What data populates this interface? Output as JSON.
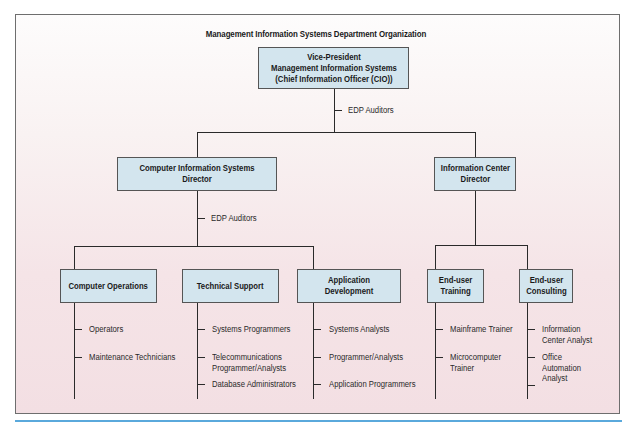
{
  "title": "Management Information Systems Department Organization",
  "colors": {
    "box_fill": "#d3e5ee",
    "box_border": "#555555",
    "line": "#2a2a2a",
    "background_top": "#fdfcfc",
    "background_bottom": "#f3dfe3",
    "rule": "#5aa9dc"
  },
  "nodes": {
    "vp": {
      "label": "Vice-President\nManagement Information Systems\n(Chief Information Officer (CIO))"
    },
    "vp_staff": {
      "label": "EDP Auditors"
    },
    "cis_director": {
      "label": "Computer Information Systems Director"
    },
    "cis_staff": {
      "label": "EDP Auditors"
    },
    "ic_director": {
      "label": "Information Center\nDirector"
    },
    "computer_operations": {
      "label": "Computer Operations",
      "roles": [
        "Operators",
        "Maintenance Technicians"
      ]
    },
    "technical_support": {
      "label": "Technical Support",
      "roles": [
        "Systems Programmers",
        "Telecommunications\nProgrammer/Analysts",
        "Database Administrators"
      ]
    },
    "application_development": {
      "label": "Application Development",
      "roles": [
        "Systems Analysts",
        "Programmer/Analysts",
        "Application Programmers"
      ]
    },
    "end_user_training": {
      "label": "End-user\nTraining",
      "roles": [
        "Mainframe Trainer",
        "Microcomputer\nTrainer"
      ]
    },
    "end_user_consulting": {
      "label": "End-user\nConsulting",
      "roles": [
        "Information\nCenter Analyst",
        "Office\nAutomation\nAnalyst",
        ""
      ]
    }
  }
}
